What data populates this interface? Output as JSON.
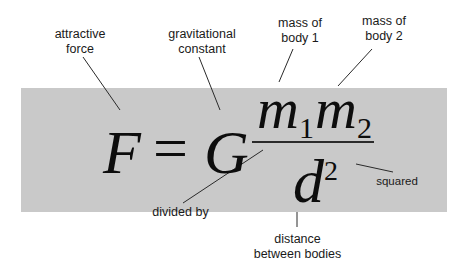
{
  "diagram": {
    "colors": {
      "panel_background": "#c9c9c9",
      "page_background": "#ffffff",
      "text": "#1a1a1a",
      "leader_lines": "#2a2a2a"
    },
    "equation": {
      "lhs": "F",
      "equals": "=",
      "constant": "G",
      "numerator": {
        "term1": {
          "symbol": "m",
          "subscript": "1"
        },
        "term2": {
          "symbol": "m",
          "subscript": "2"
        }
      },
      "denominator": {
        "symbol": "d",
        "superscript": "2"
      }
    },
    "labels": {
      "attractive_force": "attractive\nforce",
      "gravitational_constant": "gravitational\nconstant",
      "mass_body_1": "mass of\nbody 1",
      "mass_body_2": "mass of\nbody 2",
      "divided_by": "divided by",
      "squared": "squared",
      "distance": "distance\nbetween bodies"
    }
  }
}
